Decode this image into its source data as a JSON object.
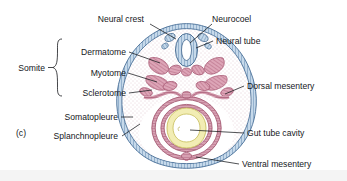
{
  "figure": {
    "panel_label": "(c)",
    "title": "",
    "background_color": "#ffffff",
    "bottom_band_color": "#f2f2f2"
  },
  "colors": {
    "outline": "#16181c",
    "ectoderm_blue": "#b9cfe4",
    "ectoderm_blue_dark": "#5f86ad",
    "somite_pink": "#dfa0b4",
    "somite_pink_dark": "#b4637f",
    "mesentery_pink": "#d9a3b5",
    "gut_yellow": "#f3efb9",
    "gut_yellow_dark": "#cfc667",
    "mesenchyme_stipple": "#c7a3b0",
    "lumen_white": "#ffffff",
    "label_text": "#16181c"
  },
  "labels": {
    "left": [
      {
        "id": "somite",
        "text": "Somite",
        "x": 16,
        "y": 71
      },
      {
        "id": "dermatome",
        "text": "Dermatome",
        "x": 66,
        "y": 55
      },
      {
        "id": "myotome",
        "text": "Myotome",
        "x": 78,
        "y": 76
      },
      {
        "id": "sclerotome",
        "text": "Sclerotome",
        "x": 68,
        "y": 96
      },
      {
        "id": "somatopleure",
        "text": "Somatopleure",
        "x": 54,
        "y": 120
      },
      {
        "id": "splanchnopleure",
        "text": "Splanchnopleure",
        "x": 42,
        "y": 139
      }
    ],
    "top": [
      {
        "id": "neural-crest",
        "text": "Neural crest",
        "x": 85,
        "y": 20
      },
      {
        "id": "neurocoel",
        "text": "Neurocoel",
        "x": 212,
        "y": 20
      }
    ],
    "right": [
      {
        "id": "neural-tube",
        "text": "Neural tube",
        "x": 216,
        "y": 43
      },
      {
        "id": "dorsal-mesentery",
        "text": "Dorsal mesentery",
        "x": 247,
        "y": 89
      },
      {
        "id": "gut-tube-cavity",
        "text": "Gut tube cavity",
        "x": 247,
        "y": 136
      },
      {
        "id": "ventral-mesentery",
        "text": "Ventral mesentery",
        "x": 242,
        "y": 167
      }
    ]
  },
  "structures": {
    "neural_tube": "dorsal hollow tube with neurocoel lumen",
    "neural_crest": "paired cell clusters dorsolateral to neural tube",
    "somites": "paired segmental blocks: dermatome, myotome, sclerotome",
    "gut_tube": "endodermal tube with yellow-walled cavity",
    "dorsal_mesentery": "suspends gut from dorsal body wall",
    "ventral_mesentery": "suspends gut to ventral body wall",
    "somatopleure": "outer body wall layer (ectoderm + somatic mesoderm)",
    "splanchnopleure": "inner layer (endoderm + splanchnic mesoderm)",
    "coelom": "body cavity between somatopleure and splanchnopleure"
  }
}
